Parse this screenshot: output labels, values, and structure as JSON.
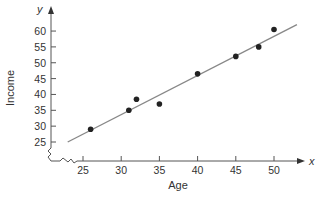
{
  "chart_data": {
    "type": "scatter",
    "title": "",
    "xlabel": "Age",
    "ylabel": "Income",
    "x_axis_letter": "x",
    "y_axis_letter": "y",
    "xlim": [
      22,
      53
    ],
    "ylim": [
      20,
      63
    ],
    "x_ticks": [
      25,
      30,
      35,
      40,
      45,
      50
    ],
    "y_ticks": [
      25,
      30,
      35,
      40,
      45,
      50,
      55,
      60
    ],
    "axis_break": true,
    "grid": false,
    "legend": null,
    "points": [
      {
        "x": 26,
        "y": 29
      },
      {
        "x": 31,
        "y": 35
      },
      {
        "x": 32,
        "y": 38.5
      },
      {
        "x": 35,
        "y": 37
      },
      {
        "x": 40,
        "y": 46.5
      },
      {
        "x": 45,
        "y": 52
      },
      {
        "x": 48,
        "y": 55
      },
      {
        "x": 50,
        "y": 60.5
      }
    ],
    "fit_line": {
      "x1": 23,
      "y1": 25,
      "x2": 53,
      "y2": 62
    },
    "colors": {
      "points": "#222222",
      "fit_line": "#888888",
      "axes": "#555555"
    }
  }
}
